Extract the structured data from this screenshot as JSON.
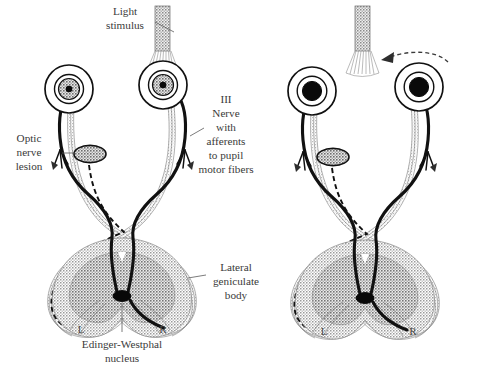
{
  "figure": {
    "background_color": "#ffffff",
    "ink_color": "#111111",
    "shade_color": "#b8b8b8",
    "label_color": "#3a3a3a"
  },
  "labels": {
    "light_stimulus": "Light\nstimulus",
    "light_stimulus_line1": "Light",
    "light_stimulus_line2": "stimulus",
    "optic_nerve_lesion_line1": "Optic",
    "optic_nerve_lesion_line2": "nerve",
    "optic_nerve_lesion_line3": "lesion",
    "third_nerve_line1": "III",
    "third_nerve_line2": "Nerve",
    "third_nerve_line3": "with",
    "third_nerve_line4": "afferents",
    "third_nerve_line5": "to pupil",
    "third_nerve_line6": "motor fibers",
    "lateral_geniculate_line1": "Lateral",
    "lateral_geniculate_line2": "geniculate",
    "lateral_geniculate_line3": "body",
    "edinger_westphal_line1": "Edinger-Westphal",
    "edinger_westphal_line2": "nucleus",
    "left_marker": "L",
    "right_marker": "R"
  },
  "panels": [
    {
      "id": "left-panel",
      "name": "light-on-left-eye",
      "light_stimulus_on": "left-eye",
      "light_stimulus_visible": true,
      "swinging_arrow_visible": false,
      "lesion_present": true,
      "lesion_side": "left",
      "left_eye": {
        "pupil_state": "constricted",
        "pupil_radius_px": 3.2,
        "iris_shaded": true
      },
      "right_eye": {
        "pupil_state": "constricted",
        "pupil_radius_px": 3.2,
        "iris_shaded": true
      },
      "left_marker": "L",
      "right_marker": "R"
    },
    {
      "id": "right-panel",
      "name": "light-swung-to-lesioned-eye",
      "light_stimulus_on": "left-eye",
      "light_stimulus_visible": true,
      "swinging_arrow_visible": true,
      "lesion_present": true,
      "lesion_side": "left",
      "left_eye": {
        "pupil_state": "dilated",
        "pupil_radius_px": 9.5,
        "iris_shaded": false
      },
      "right_eye": {
        "pupil_state": "dilated",
        "pupil_radius_px": 9.5,
        "iris_shaded": false
      },
      "left_marker": "L",
      "right_marker": "R"
    }
  ],
  "icons": {
    "light_beam": "light-beam-icon",
    "lesion": "lesion-oval-icon",
    "nucleus": "edinger-westphal-nucleus-icon",
    "swing_arrow": "swinging-flashlight-arrow-icon"
  }
}
